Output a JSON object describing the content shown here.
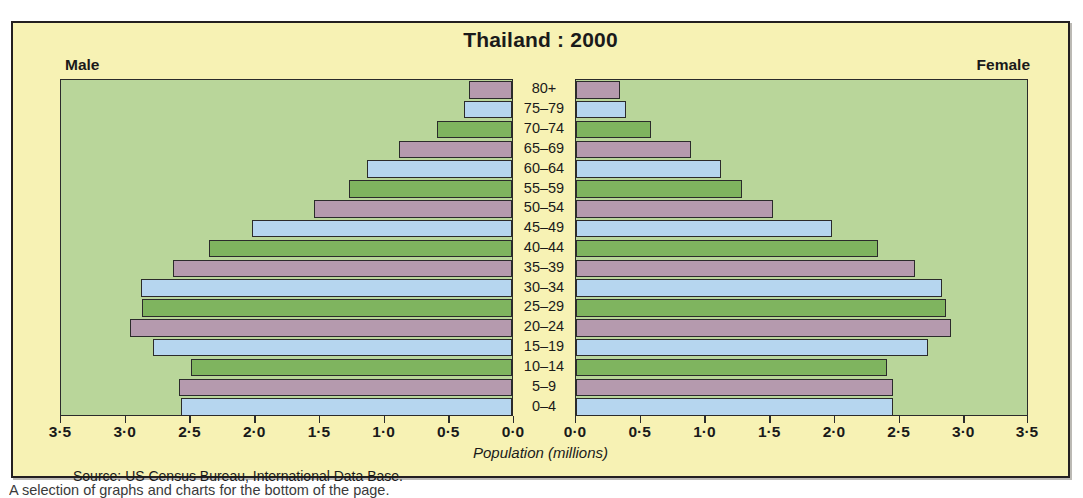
{
  "figure": {
    "title": "Thailand : 2000",
    "male_label": "Male",
    "female_label": "Female",
    "axis_title": "Population (millions)",
    "source": "Source: US  Census Bureau, International Data Base.",
    "page_text_fragment": "A selection of graphs and charts for the bottom of the page.",
    "colors": {
      "panel_background": "#f7f2b4",
      "plot_background": "#b9d69a",
      "bar_mauve": "#b59aae",
      "bar_blue": "#b6d6ef",
      "bar_green": "#7fb45f",
      "outline": "#2b2b2b",
      "text": "#1a1a1a"
    }
  },
  "chart_data": {
    "type": "bar",
    "subtype": "population-pyramid",
    "title": "Thailand : 2000",
    "xlabel": "Population (millions)",
    "ylabel": "",
    "xlim": [
      0,
      3.5
    ],
    "xticks": [
      "3·5",
      "3·0",
      "2·5",
      "2·0",
      "1·5",
      "1·0",
      "0·5",
      "0·0"
    ],
    "xticks_left": [
      "3·5",
      "3·0",
      "2·5",
      "2·0",
      "1·5",
      "1·0",
      "0·5",
      "0·0"
    ],
    "xticks_right": [
      "0·0",
      "0·5",
      "1·0",
      "1·5",
      "2·0",
      "2·5",
      "3·0",
      "3·5"
    ],
    "grid": false,
    "legend": [
      "Male",
      "Female"
    ],
    "legend_position": "top-left and top-right",
    "categories": [
      "80+",
      "75–79",
      "70–74",
      "65–69",
      "60–64",
      "55–59",
      "50–54",
      "45–49",
      "40–44",
      "35–39",
      "30–34",
      "25–29",
      "20–24",
      "15–19",
      "10–14",
      "5–9",
      "0–4"
    ],
    "series": [
      {
        "name": "Male",
        "side": "left",
        "values": [
          0.33,
          0.37,
          0.58,
          0.87,
          1.12,
          1.26,
          1.53,
          2.01,
          2.34,
          2.62,
          2.87,
          2.86,
          2.95,
          2.77,
          2.48,
          2.57,
          2.56
        ]
      },
      {
        "name": "Female",
        "side": "right",
        "values": [
          0.34,
          0.39,
          0.58,
          0.89,
          1.12,
          1.28,
          1.52,
          1.98,
          2.33,
          2.62,
          2.83,
          2.86,
          2.9,
          2.72,
          2.4,
          2.45,
          2.45
        ]
      }
    ],
    "bar_colors": [
      "mauve",
      "blue",
      "green",
      "mauve",
      "blue",
      "green",
      "mauve",
      "blue",
      "green",
      "mauve",
      "blue",
      "green",
      "mauve",
      "blue",
      "green",
      "mauve",
      "blue"
    ],
    "source": "Source: US  Census Bureau, International Data Base."
  }
}
